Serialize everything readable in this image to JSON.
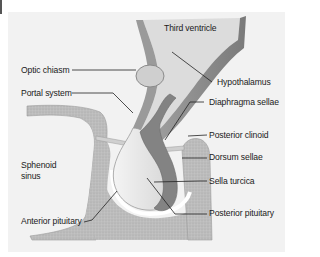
{
  "diagram": {
    "colors": {
      "background": "#f2f2f2",
      "bone": "#b9b9b9",
      "bone_light": "#d6d6d6",
      "brain_tissue": "#8f8f8f",
      "anterior_pituitary": "#e6e6e6",
      "posterior_pituitary": "#7d7d7d",
      "ventricle_fill": "#dcdcdc",
      "leader_line": "#222222"
    },
    "labels": {
      "third_ventricle": "Third ventricle",
      "optic_chiasm": "Optic chiasm",
      "hypothalamus": "Hypothalamus",
      "portal_system": "Portal system",
      "diaphragma_sellae": "Diaphragma sellae",
      "posterior_clinoid": "Posterior clinoid",
      "dorsum_sellae": "Dorsum sellae",
      "sphenoid_sinus_line1": "Sphenoid",
      "sphenoid_sinus_line2": "sinus",
      "sella_turcica": "Sella turcica",
      "anterior_pituitary": "Anterior pituitary",
      "posterior_pituitary": "Posterior pituitary"
    }
  }
}
